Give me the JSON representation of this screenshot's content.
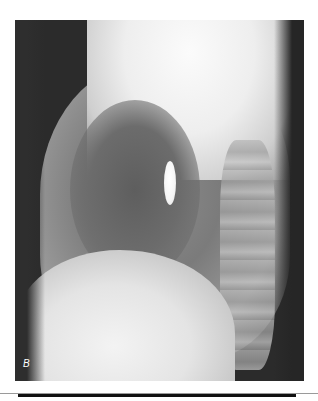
{
  "figure": {
    "panel_label": "B",
    "colors": {
      "background": "#ffffff",
      "film_dark": "#2b2b2b",
      "rule": "#111111"
    }
  }
}
